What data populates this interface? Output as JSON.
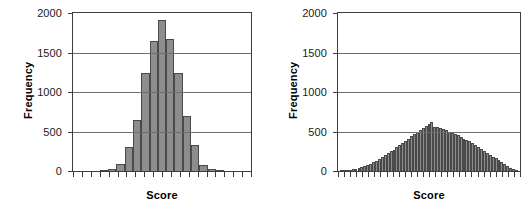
{
  "figure": {
    "panels": [
      {
        "id": "left",
        "xlabel": "Score",
        "ylabel": "Frequency"
      },
      {
        "id": "right",
        "xlabel": "Score",
        "ylabel": "Frequency"
      }
    ]
  },
  "chart_data": [
    {
      "type": "bar",
      "title": "",
      "subtitle": "",
      "xlabel": "Score",
      "ylabel": "Frequency",
      "ylim": [
        0,
        2000
      ],
      "yticks": [
        0,
        500,
        1000,
        1500,
        2000
      ],
      "ytick_labels": [
        "0",
        "500",
        "1000",
        "1500",
        "2000"
      ],
      "xticks_count": 21,
      "xtick_labels": [],
      "grid": "horizontal",
      "legend": "none",
      "bar_color": "#8d8d8d",
      "bar_edge_color": "#4a4a4a",
      "n_bins": 21,
      "categories": [
        "1",
        "2",
        "3",
        "4",
        "5",
        "6",
        "7",
        "8",
        "9",
        "10",
        "11",
        "12",
        "13",
        "14",
        "15",
        "16",
        "17",
        "18",
        "19",
        "20",
        "21"
      ],
      "values": [
        0,
        0,
        0,
        10,
        25,
        90,
        310,
        650,
        1235,
        1650,
        1910,
        1665,
        1235,
        695,
        335,
        75,
        30,
        10,
        0,
        0,
        0
      ],
      "description": "Narrow, tall normal-shaped histogram peaking near 1910"
    },
    {
      "type": "bar",
      "title": "",
      "subtitle": "",
      "xlabel": "Score",
      "ylabel": "Frequency",
      "ylim": [
        0,
        2000
      ],
      "yticks": [
        0,
        500,
        1000,
        1500,
        2000
      ],
      "ytick_labels": [
        "0",
        "500",
        "1000",
        "1500",
        "2000"
      ],
      "xticks_count": 31,
      "xtick_labels": [],
      "grid": "horizontal",
      "legend": "none",
      "bar_color": "#8d8d8d",
      "bar_edge_color": "#4a4a4a",
      "n_bins": 61,
      "categories": [
        "1",
        "2",
        "3",
        "4",
        "5",
        "6",
        "7",
        "8",
        "9",
        "10",
        "11",
        "12",
        "13",
        "14",
        "15",
        "16",
        "17",
        "18",
        "19",
        "20",
        "21",
        "22",
        "23",
        "24",
        "25",
        "26",
        "27",
        "28",
        "29",
        "30",
        "31",
        "32",
        "33",
        "34",
        "35",
        "36",
        "37",
        "38",
        "39",
        "40",
        "41",
        "42",
        "43",
        "44",
        "45",
        "46",
        "47",
        "48",
        "49",
        "50",
        "51",
        "52",
        "53",
        "54",
        "55",
        "56",
        "57",
        "58",
        "59",
        "60",
        "61"
      ],
      "values": [
        5,
        8,
        12,
        15,
        20,
        25,
        35,
        45,
        60,
        75,
        95,
        110,
        130,
        155,
        175,
        200,
        225,
        250,
        270,
        300,
        330,
        355,
        385,
        410,
        440,
        465,
        490,
        520,
        545,
        575,
        600,
        620,
        560,
        555,
        545,
        535,
        525,
        500,
        475,
        465,
        450,
        430,
        405,
        390,
        375,
        350,
        330,
        305,
        280,
        255,
        230,
        205,
        180,
        160,
        135,
        110,
        85,
        60,
        40,
        25,
        12
      ],
      "description": "Broad, low normal-shaped histogram peaking near 620"
    }
  ]
}
